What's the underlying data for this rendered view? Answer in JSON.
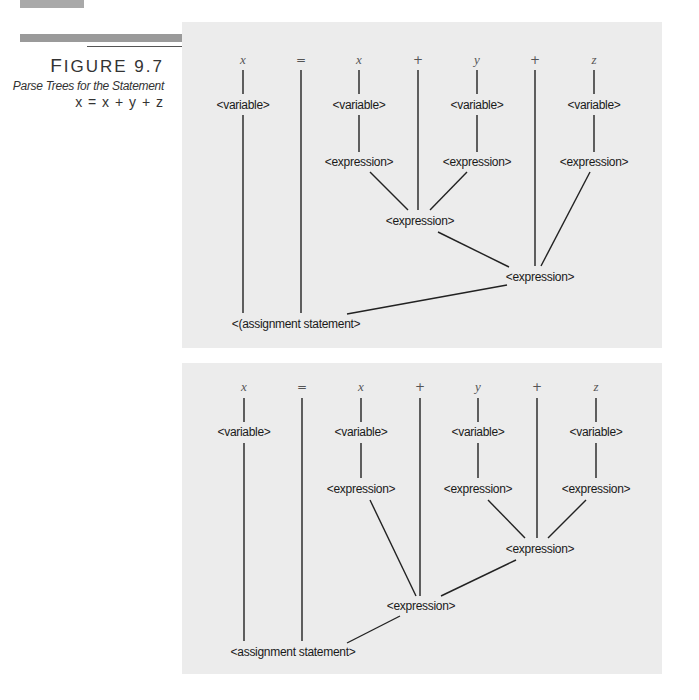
{
  "caption": {
    "figure_label": "Figure 9.7",
    "figure_first": "F",
    "figure_rest": "IGURE 9.7",
    "subtitle": "Parse Trees for the Statement",
    "statement": "x = x + y + z"
  },
  "tokens": [
    "x",
    "=",
    "x",
    "+",
    "y",
    "+",
    "z"
  ],
  "nodes": {
    "variable": "<variable>",
    "expression": "<expression>",
    "assignment_1": "<(assignment statement>",
    "assignment_2": "<assignment statement>"
  },
  "trees": [
    {
      "name": "left-associative parse tree",
      "structure": "((x + y) + z)"
    },
    {
      "name": "right-associative parse tree",
      "structure": "(x + (y + z))"
    }
  ]
}
